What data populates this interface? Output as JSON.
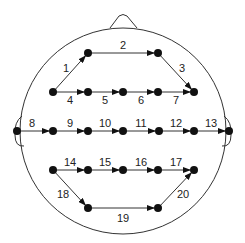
{
  "diagram": {
    "type": "eeg-head-montage",
    "colors": {
      "stroke": "#333333",
      "node": "#111111",
      "text": "#222222",
      "background": "#ffffff"
    },
    "head": {
      "cx": 123,
      "cy": 131,
      "r": 103
    },
    "nodes": [
      {
        "id": "a1",
        "x": 88,
        "y": 53
      },
      {
        "id": "a2",
        "x": 158,
        "y": 53
      },
      {
        "id": "b1",
        "x": 53,
        "y": 92
      },
      {
        "id": "b2",
        "x": 88,
        "y": 92
      },
      {
        "id": "b3",
        "x": 123,
        "y": 92
      },
      {
        "id": "b4",
        "x": 158,
        "y": 92
      },
      {
        "id": "b5",
        "x": 194,
        "y": 92
      },
      {
        "id": "c1",
        "x": 17,
        "y": 131
      },
      {
        "id": "c2",
        "x": 53,
        "y": 131
      },
      {
        "id": "c3",
        "x": 88,
        "y": 131
      },
      {
        "id": "c4",
        "x": 123,
        "y": 131
      },
      {
        "id": "c5",
        "x": 159,
        "y": 131
      },
      {
        "id": "c6",
        "x": 194,
        "y": 131
      },
      {
        "id": "c7",
        "x": 229,
        "y": 131
      },
      {
        "id": "d1",
        "x": 53,
        "y": 170
      },
      {
        "id": "d2",
        "x": 88,
        "y": 170
      },
      {
        "id": "d3",
        "x": 123,
        "y": 170
      },
      {
        "id": "d4",
        "x": 158,
        "y": 170
      },
      {
        "id": "d5",
        "x": 194,
        "y": 170
      },
      {
        "id": "e1",
        "x": 88,
        "y": 208
      },
      {
        "id": "e2",
        "x": 158,
        "y": 208
      }
    ],
    "edges": [
      {
        "label": "1",
        "from": "b1",
        "to": "a1",
        "lx": 66,
        "ly": 72
      },
      {
        "label": "2",
        "from": "a1",
        "to": "a2",
        "lx": 123,
        "ly": 49
      },
      {
        "label": "3",
        "from": "a2",
        "to": "b5",
        "lx": 182,
        "ly": 72
      },
      {
        "label": "4",
        "from": "b1",
        "to": "b2",
        "lx": 70,
        "ly": 104
      },
      {
        "label": "5",
        "from": "b2",
        "to": "b3",
        "lx": 105,
        "ly": 104
      },
      {
        "label": "6",
        "from": "b3",
        "to": "b4",
        "lx": 141,
        "ly": 104
      },
      {
        "label": "7",
        "from": "b4",
        "to": "b5",
        "lx": 176,
        "ly": 104
      },
      {
        "label": "8",
        "from": "c1",
        "to": "c2",
        "lx": 32,
        "ly": 127
      },
      {
        "label": "9",
        "from": "c2",
        "to": "c3",
        "lx": 70,
        "ly": 127
      },
      {
        "label": "10",
        "from": "c3",
        "to": "c4",
        "lx": 105,
        "ly": 127
      },
      {
        "label": "11",
        "from": "c4",
        "to": "c5",
        "lx": 141,
        "ly": 127
      },
      {
        "label": "12",
        "from": "c5",
        "to": "c6",
        "lx": 176,
        "ly": 127
      },
      {
        "label": "13",
        "from": "c6",
        "to": "c7",
        "lx": 211,
        "ly": 127
      },
      {
        "label": "14",
        "from": "d1",
        "to": "d2",
        "lx": 70,
        "ly": 166
      },
      {
        "label": "15",
        "from": "d2",
        "to": "d3",
        "lx": 105,
        "ly": 166
      },
      {
        "label": "16",
        "from": "d3",
        "to": "d4",
        "lx": 141,
        "ly": 166
      },
      {
        "label": "17",
        "from": "d4",
        "to": "d5",
        "lx": 176,
        "ly": 166
      },
      {
        "label": "18",
        "from": "d1",
        "to": "e1",
        "lx": 63,
        "ly": 198
      },
      {
        "label": "19",
        "from": "e1",
        "to": "e2",
        "lx": 123,
        "ly": 222
      },
      {
        "label": "20",
        "from": "e2",
        "to": "d5",
        "lx": 183,
        "ly": 198
      }
    ]
  }
}
